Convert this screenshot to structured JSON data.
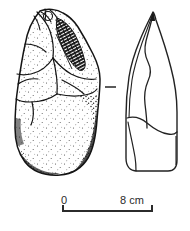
{
  "figure": {
    "kind": "archaeological-lithic-illustration",
    "background_color": "#ffffff",
    "ink_color": "#1a1a1a"
  },
  "views": {
    "face_view": {
      "name": "face-view",
      "label": "",
      "shading": "stippled-and-hatched",
      "position": {
        "x": 14,
        "y": 10,
        "width": 88,
        "height": 165
      }
    },
    "profile_view": {
      "name": "profile-view",
      "label": "",
      "shading": "outline-only",
      "position": {
        "x": 124,
        "y": 12,
        "width": 55,
        "height": 161
      }
    },
    "separator": {
      "name": "view-separator-dash",
      "glyph": "—",
      "position": {
        "x": 105,
        "y": 87,
        "width": 11,
        "height": 2
      }
    }
  },
  "scale_bar": {
    "start_label": "0",
    "end_label": "8 cm",
    "unit": "cm",
    "start_value": 0,
    "end_value": 8,
    "bar_x_start": 63,
    "bar_x_end": 152,
    "bar_y": 211,
    "tick_height": 6,
    "line_color": "#2b2b2b"
  }
}
